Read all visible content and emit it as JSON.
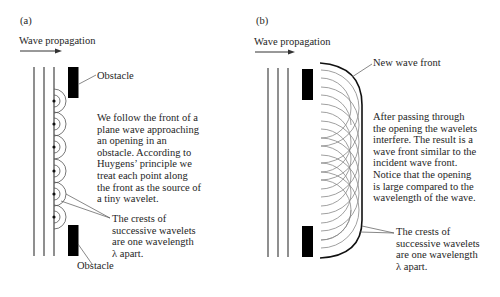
{
  "panel_a": {
    "label": "(a)",
    "propagation_label": "Wave propagation",
    "obstacle_top_label": "Obstacle",
    "obstacle_bottom_label": "Obstacle",
    "description_lines": [
      "We follow the front of a",
      "plane wave approaching",
      "an opening in an",
      "obstacle. According to",
      "Huygens’ principle we",
      "treat each point along",
      "the front as the source of",
      "a tiny wavelet."
    ],
    "crests_lines": [
      "The crests of",
      "successive wavelets",
      "are one wavelength",
      "λ apart."
    ]
  },
  "panel_b": {
    "label": "(b)",
    "propagation_label": "Wave propagation",
    "new_wave_front_label": "New wave front",
    "description_lines": [
      "After passing through",
      "the opening the wavelets",
      "interfere. The result is a",
      "wave front similar to the",
      "incident wave front.",
      "Notice that the opening",
      "is large compared to the",
      "wavelength of the wave."
    ],
    "crests_lines": [
      "The crests of",
      "successive wavelets",
      "are one wavelength",
      "λ apart."
    ]
  },
  "colors": {
    "ink": "#1e1e1e",
    "wavelet": "#7a7a7a",
    "obstacle": "#000000"
  }
}
